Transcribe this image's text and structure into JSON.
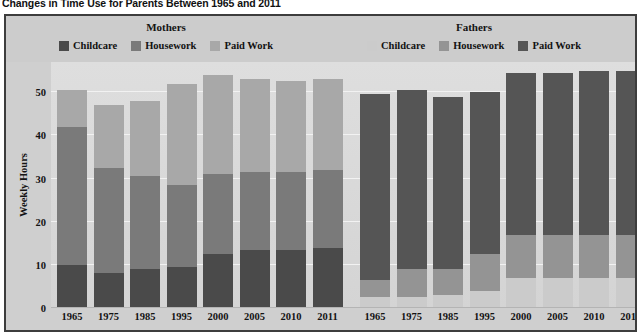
{
  "title": "Changes in Time Use for Parents Between 1965 and 2011",
  "legend": {
    "mothers": {
      "group_label": "Mothers",
      "items": [
        {
          "label": "Childcare",
          "color": "#4a4a4a"
        },
        {
          "label": "Housework",
          "color": "#7a7a7a"
        },
        {
          "label": "Paid Work",
          "color": "#a8a8a8"
        }
      ]
    },
    "fathers": {
      "group_label": "Fathers",
      "items": [
        {
          "label": "Childcare",
          "color": "#cbcbcb"
        },
        {
          "label": "Housework",
          "color": "#949494"
        },
        {
          "label": "Paid Work",
          "color": "#555555"
        }
      ]
    }
  },
  "chart_data": {
    "type": "bar",
    "subtype": "stacked",
    "title": "Changes in Time Use for Parents Between 1965 and 2011",
    "xlabel": "",
    "ylabel": "Weekly Hours",
    "ylim": [
      0,
      57
    ],
    "yticks": [
      0,
      10,
      20,
      30,
      40,
      50
    ],
    "grid": true,
    "legend_position": "top",
    "groups": [
      "Mothers",
      "Fathers"
    ],
    "categories": [
      "1965",
      "1975",
      "1985",
      "1995",
      "2000",
      "2005",
      "2010",
      "2011"
    ],
    "panels": [
      {
        "group": "Mothers",
        "series": [
          {
            "name": "Childcare",
            "color": "#4a4a4a",
            "values": [
              10,
              8,
              9,
              9.5,
              12.5,
              13.5,
              13.5,
              14
            ]
          },
          {
            "name": "Housework",
            "color": "#7a7a7a",
            "values": [
              32,
              24.5,
              21.5,
              19,
              18.5,
              18,
              18,
              18
            ]
          },
          {
            "name": "Paid Work",
            "color": "#a8a8a8",
            "values": [
              8.5,
              14.5,
              17.5,
              23.5,
              23,
              21.5,
              21,
              21
            ]
          }
        ],
        "totals": [
          50.5,
          47,
          48,
          52,
          54,
          53,
          52.5,
          53
        ]
      },
      {
        "group": "Fathers",
        "series": [
          {
            "name": "Childcare",
            "color": "#cbcbcb",
            "values": [
              2.5,
              2.5,
              3,
              4,
              7,
              7,
              7,
              7
            ]
          },
          {
            "name": "Housework",
            "color": "#949494",
            "values": [
              4,
              6.5,
              6,
              8.5,
              10,
              10,
              10,
              10
            ]
          },
          {
            "name": "Paid Work",
            "color": "#555555",
            "values": [
              43,
              41.5,
              40,
              37.5,
              37.5,
              37.5,
              38,
              38
            ]
          }
        ],
        "totals": [
          49.5,
          50.5,
          49,
          50,
          54.5,
          54.5,
          55,
          55
        ]
      }
    ]
  },
  "colors": {
    "panel_background": "#cfcfcf",
    "plot_background": "#d8d8d8",
    "frame": "#3d3d3d",
    "gridline": "#f2f2f2",
    "text": "#141414"
  }
}
